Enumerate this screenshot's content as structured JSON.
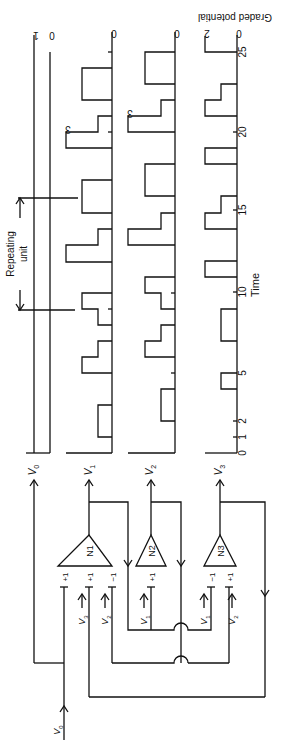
{
  "figure": {
    "orientation": "rotated 90 degrees clockwise",
    "ylabel": "Graded potential",
    "xlabel": "Time",
    "annotation": "Repeating unit",
    "time_ticks": [
      "0",
      "1",
      "2",
      "5",
      "10",
      "15",
      "20",
      "25"
    ],
    "rows": [
      {
        "signal": "V0",
        "levels": [
          "1",
          "0"
        ]
      },
      {
        "signal": "V1",
        "levels": [
          "0"
        ],
        "peak_label": "3"
      },
      {
        "signal": "V2",
        "levels": [
          "0"
        ],
        "peak_label": "3"
      },
      {
        "signal": "V3",
        "levels": [
          "2",
          "0"
        ]
      }
    ],
    "neurons": [
      {
        "name": "N1",
        "inputs": [
          {
            "sign": "+1",
            "source": "V0"
          },
          {
            "sign": "+1",
            "source": "V3"
          },
          {
            "sign": "-1",
            "source": "V2"
          }
        ],
        "output": "V1"
      },
      {
        "name": "N2",
        "inputs": [
          {
            "sign": "+1",
            "source": "V1"
          }
        ],
        "output": "V2"
      },
      {
        "name": "N3",
        "inputs": [
          {
            "sign": "-1",
            "source": "V1"
          },
          {
            "sign": "+1",
            "source": "V2"
          }
        ],
        "output": "V3"
      }
    ]
  },
  "labels": {
    "v0": "V",
    "v0_sub": "0",
    "v1": "V",
    "v1_sub": "1",
    "v2": "V",
    "v2_sub": "2",
    "v3": "V",
    "v3_sub": "3",
    "n1": "N1",
    "n2": "N2",
    "n3": "N3",
    "plus1": "+1",
    "minus1": "−1",
    "three": "3",
    "one": "1",
    "zero": "0",
    "two": "2",
    "t0": "0",
    "t1": "1",
    "t2": "2",
    "t5": "5",
    "t10": "10",
    "t15": "15",
    "t20": "20",
    "t25": "25",
    "time": "Time",
    "graded": "Graded potential",
    "repeating": "Repeating",
    "unit": "unit"
  }
}
